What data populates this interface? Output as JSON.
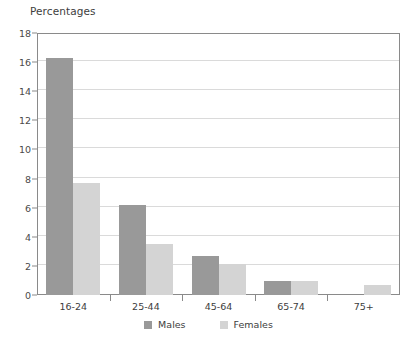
{
  "chart_data": {
    "type": "bar",
    "title": "Percentages",
    "xlabel": "",
    "ylabel": "",
    "ylim": [
      0,
      18
    ],
    "yticks": [
      0,
      2,
      4,
      6,
      8,
      10,
      12,
      14,
      16,
      18
    ],
    "grid": true,
    "legend_position": "bottom",
    "categories": [
      "16-24",
      "25-44",
      "45-64",
      "65-74",
      "75+"
    ],
    "series": [
      {
        "name": "Males",
        "color": "#999999",
        "values": [
          16.3,
          6.2,
          2.7,
          0.95,
          0
        ]
      },
      {
        "name": "Females",
        "color": "#d4d4d4",
        "values": [
          7.7,
          3.5,
          2.1,
          0.95,
          0.7
        ]
      }
    ]
  },
  "colors": {
    "males": "#999999",
    "females": "#d4d4d4",
    "axis": "#8a8a8a",
    "gridline": "#dadada",
    "text": "#3d3d3d"
  }
}
